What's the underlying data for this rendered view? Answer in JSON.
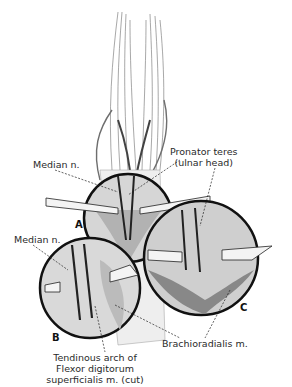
{
  "figure": {
    "insets": [
      {
        "letter": "A",
        "cx": 128,
        "cy": 218,
        "r": 44
      },
      {
        "letter": "B",
        "cx": 90,
        "cy": 288,
        "r": 50
      },
      {
        "letter": "C",
        "cx": 201,
        "cy": 258,
        "r": 57
      }
    ],
    "labels": {
      "median_top": "Median n.",
      "pronator_line1": "Pronator teres",
      "pronator_line2": "(ulnar head)",
      "median_left": "Median n.",
      "brachioradialis": "Brachioradialis m.",
      "tendinous_line1": "Tendinous arch of",
      "tendinous_line2": "Flexor digitorum",
      "tendinous_line3": "superficialis m. (cut)"
    },
    "letters": {
      "a": "A",
      "b": "B",
      "c": "C"
    },
    "colors": {
      "ink": "#1a1a1a",
      "background": "#ffffff"
    }
  }
}
